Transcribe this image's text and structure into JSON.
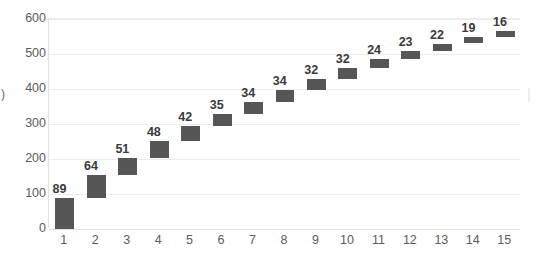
{
  "chart_data": {
    "type": "bar",
    "subtype": "waterfall",
    "title": "",
    "xlabel": "",
    "ylabel": ")",
    "categories": [
      "1",
      "2",
      "3",
      "4",
      "5",
      "6",
      "7",
      "8",
      "9",
      "10",
      "11",
      "12",
      "13",
      "14",
      "15"
    ],
    "values": [
      89,
      64,
      51,
      48,
      42,
      35,
      34,
      34,
      32,
      32,
      24,
      23,
      22,
      19,
      16
    ],
    "bar_bases": [
      0,
      89,
      153,
      204,
      252,
      294,
      329,
      363,
      397,
      429,
      461,
      485,
      508,
      530,
      549
    ],
    "bar_tops": [
      89,
      153,
      204,
      252,
      294,
      329,
      363,
      397,
      429,
      461,
      485,
      508,
      530,
      549,
      565
    ],
    "data_labels": [
      "89",
      "64",
      "51",
      "48",
      "42",
      "35",
      "34",
      "34",
      "32",
      "32",
      "24",
      "23",
      "22",
      "19",
      "16"
    ],
    "ylim": [
      0,
      600
    ],
    "y_ticks": [
      0,
      100,
      200,
      300,
      400,
      500,
      600
    ],
    "y_tick_labels": [
      "0",
      "100",
      "200",
      "300",
      "400",
      "500",
      "600"
    ],
    "grid": true,
    "grid_axis": "y",
    "legend": "none",
    "bar_color": "#565656",
    "gridline_color": "#ececec",
    "axis_text_color": "#5b5b5b",
    "label_text_color": "#3a3a3a",
    "background_color": "#ffffff"
  },
  "axis": {
    "y_title_clipped": ")"
  }
}
